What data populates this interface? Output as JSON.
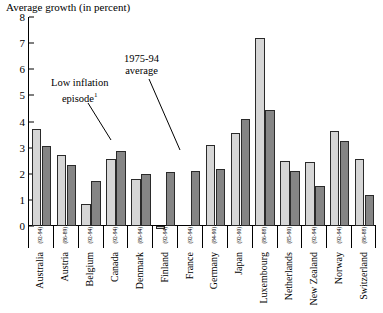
{
  "chart_data": {
    "type": "bar",
    "title": "Average growth (in percent)",
    "xlabel": "",
    "ylabel": "Average growth (in percent)",
    "ylim": [
      0,
      8
    ],
    "yticks": [
      0,
      1,
      2,
      3,
      4,
      5,
      6,
      7,
      8
    ],
    "grid": false,
    "legend_position": "none",
    "categories": [
      "Australia",
      "Austria",
      "Belgium",
      "Canada",
      "Denmark",
      "Finland",
      "France",
      "Germany",
      "Japan",
      "Luxembourg",
      "Netherlands",
      "New Zealand",
      "Norway",
      "Switzerland"
    ],
    "episode_years": [
      "(92-94)",
      "(86-89)",
      "(92-94)",
      "(92-94)",
      "(86-94)",
      "(92-94)",
      "(92-94)",
      "(84-90)",
      "(92-90)",
      "(86-88)",
      "(85-90)",
      "(92-94)",
      "(92-94)",
      "(86-88)"
    ],
    "series": [
      {
        "name": "Low inflation episode",
        "values": [
          3.7,
          2.7,
          0.85,
          2.55,
          1.8,
          -0.1,
          0.0,
          3.1,
          3.55,
          7.2,
          2.5,
          2.45,
          3.65,
          2.55
        ]
      },
      {
        "name": "1975-94 average",
        "values": [
          3.05,
          2.35,
          1.72,
          2.88,
          2.0,
          2.05,
          2.12,
          2.18,
          4.1,
          4.45,
          2.1,
          1.55,
          3.25,
          1.2
        ]
      }
    ],
    "annotations": [
      {
        "text_line1": "Low inflation",
        "text_line2": "episode",
        "footnote": "1"
      },
      {
        "text_line1": "1975-94",
        "text_line2": "average",
        "footnote": ""
      }
    ],
    "colors": {
      "light_bar": "#d6d6d6",
      "dark_bar": "#858585",
      "outline": "#2a2a2a",
      "axis": "#000000",
      "background": "#ffffff"
    }
  }
}
